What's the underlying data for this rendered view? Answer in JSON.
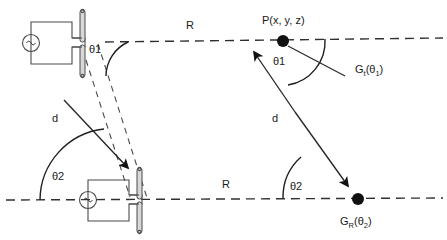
{
  "figure": {
    "background_color": "#ffffff",
    "line_color": "#2b2b2b",
    "width": 447,
    "height": 240
  },
  "labels": {
    "range_top": "R",
    "range_bottom": "R",
    "theta1_left": "θ1",
    "theta2_left": "θ2",
    "theta1_right": "θ1",
    "theta2_right": "θ2",
    "distance_left": "d",
    "distance_right": "d",
    "point_p": "P(x, y, z)",
    "gain_transmit": "G",
    "gain_transmit_sub": "t",
    "gain_transmit_arg_open": "(θ",
    "gain_transmit_arg_sub": "1",
    "gain_transmit_arg_close": ")",
    "gain_receive": "G",
    "gain_receive_sub": "R",
    "gain_receive_arg_open": "(θ",
    "gain_receive_arg_sub": "2",
    "gain_receive_arg_close": ")"
  },
  "elements": {
    "antenna_top": "transmitting-dipole-antenna-with-ac-source",
    "antenna_bottom": "receiving-dipole-antenna-with-ac-source",
    "point_marker_top": "field-point-p",
    "point_marker_bottom": "receive-point-marker",
    "boresight_top": "top-boresight-dashed-axis",
    "boresight_bottom": "bottom-boresight-dashed-axis",
    "construction_line": "dashed-construction-line"
  }
}
